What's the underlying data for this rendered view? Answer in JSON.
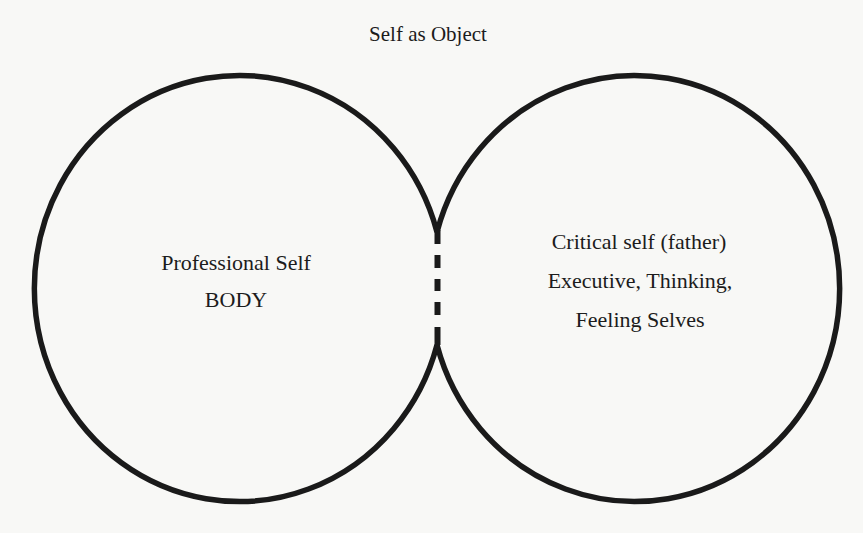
{
  "diagram": {
    "title": "Self as Object",
    "left_circle": {
      "lines": [
        "Professional Self",
        "BODY"
      ]
    },
    "right_circle": {
      "lines": [
        "Critical self (father)",
        "Executive, Thinking,",
        "Feeling Selves"
      ]
    },
    "junction": {
      "style": "dashed",
      "dash_count": 3
    },
    "colors": {
      "stroke": "#1a1a1a",
      "background": "#f8f8f6",
      "text": "#1c1c1c"
    }
  }
}
